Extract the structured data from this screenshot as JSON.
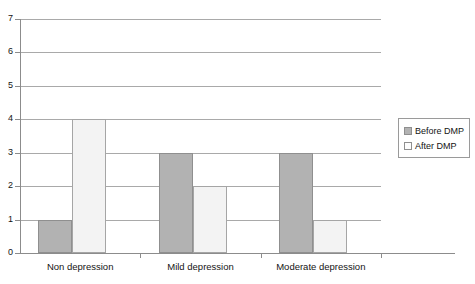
{
  "chart_data": {
    "type": "bar",
    "title": "",
    "subtitle": "",
    "xlabel": "",
    "ylabel": "",
    "categories": [
      "Non depression",
      "Mild depression",
      "Moderate depression"
    ],
    "series": [
      {
        "name": "Before DMP",
        "values": [
          1,
          3,
          3
        ],
        "color": "#b2b2b2"
      },
      {
        "name": "After DMP",
        "values": [
          4,
          2,
          1
        ],
        "color": "#f3f3f3"
      }
    ],
    "ylim": [
      0,
      7
    ],
    "ytick_labels": [
      "0",
      "1",
      "2",
      "3",
      "4",
      "5",
      "6",
      "7"
    ],
    "ytick_values": [
      0,
      1,
      2,
      3,
      4,
      5,
      6,
      7
    ],
    "grid": true,
    "grid_axis": "y",
    "legend_position": "right",
    "annotations": []
  },
  "legend": {
    "entries": [
      {
        "label": "Before DMP"
      },
      {
        "label": "After DMP"
      }
    ]
  }
}
